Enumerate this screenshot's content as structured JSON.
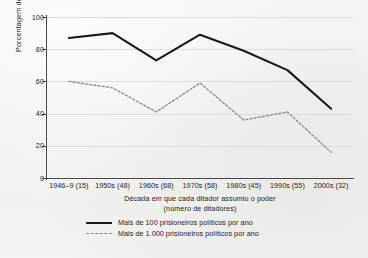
{
  "chart_data": {
    "type": "line",
    "title": "",
    "subtitle": "",
    "xlabel": "Década em que cada ditador assumiu o poder",
    "xlabel_line2": "(número de ditadores)",
    "ylabel": "Porcentagem de ditadores",
    "categories": [
      "1946–9 (15)",
      "1950s (48)",
      "1960s (68)",
      "1970s (58)",
      "1980s (45)",
      "1990s (55)",
      "2000s (32)"
    ],
    "series": [
      {
        "name": "Mais de 100 prisioneiros políticos por ano",
        "style": "solid",
        "color": "#1a1a1a",
        "values": [
          87,
          90,
          73,
          89,
          79,
          67,
          43
        ]
      },
      {
        "name": "Mais de 1.000 prisioneiros políticos por ano",
        "style": "dotted",
        "color": "#8a8a8a",
        "values": [
          60,
          56,
          41,
          59,
          36,
          41,
          16
        ]
      }
    ],
    "ylim": [
      0,
      100
    ],
    "yticks": [
      0,
      20,
      40,
      60,
      80,
      100
    ],
    "ytick_labels": [
      "0",
      "20",
      "40",
      "60",
      "80",
      "100"
    ],
    "grid": true,
    "grid_axis": "y",
    "legend_position": "bottom-center"
  },
  "legend": {
    "entries": [
      {
        "label": "Mais de 100 prisioneiros políticos por ano",
        "style": "solid"
      },
      {
        "label": "Mais de 1.000 prisioneiros políticos por ano",
        "style": "dotted"
      }
    ]
  },
  "colors": {
    "background": "#f2f2f0",
    "axis": "#4a4a4a",
    "grid": "#dcdcd8",
    "text": "#1d1d1d",
    "series_solid": "#1a1a1a",
    "series_dotted": "#8a8a8a"
  }
}
